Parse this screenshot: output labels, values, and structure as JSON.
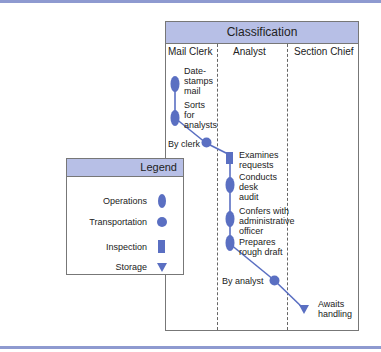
{
  "diagram": {
    "title": "Classification",
    "lanes": [
      {
        "name": "Mail Clerk"
      },
      {
        "name": "Analyst"
      },
      {
        "name": "Section Chief"
      }
    ],
    "steps": [
      {
        "lane": "Mail Clerk",
        "type": "Operations",
        "label": "Date-stamps mail",
        "lines": [
          "Date-",
          "stamps",
          "mail"
        ]
      },
      {
        "lane": "Mail Clerk",
        "type": "Operations",
        "label": "Sorts for analysts",
        "lines": [
          "Sorts",
          "for",
          "analysts"
        ]
      },
      {
        "lane": "Mail Clerk",
        "type": "Transportation",
        "label": "By clerk"
      },
      {
        "lane": "Analyst",
        "type": "Inspection",
        "label": "Examines requests",
        "lines": [
          "Examines",
          "requests"
        ]
      },
      {
        "lane": "Analyst",
        "type": "Operations",
        "label": "Conducts desk audit",
        "lines": [
          "Conducts",
          "desk",
          "audit"
        ]
      },
      {
        "lane": "Analyst",
        "type": "Operations",
        "label": "Confers with administrative officer",
        "lines": [
          "Confers with",
          "administrative",
          "officer"
        ]
      },
      {
        "lane": "Analyst",
        "type": "Operations",
        "label": "Prepares rough draft",
        "lines": [
          "Prepares",
          "rough draft"
        ]
      },
      {
        "lane": "Analyst",
        "type": "Transportation",
        "label": "By analyst"
      },
      {
        "lane": "Section Chief",
        "type": "Storage",
        "label": "Awaits handling",
        "lines": [
          "Awaits",
          "handling"
        ]
      }
    ]
  },
  "legend": {
    "title": "Legend",
    "items": [
      {
        "label": "Operations",
        "shape": "ellipse"
      },
      {
        "label": "Transportation",
        "shape": "circle"
      },
      {
        "label": "Inspection",
        "shape": "rectangle"
      },
      {
        "label": "Storage",
        "shape": "triangle-down"
      }
    ]
  },
  "colors": {
    "accent": "#5a6fc2",
    "header_fill": "#b7bfe6",
    "rule": "#8e9ad0"
  }
}
